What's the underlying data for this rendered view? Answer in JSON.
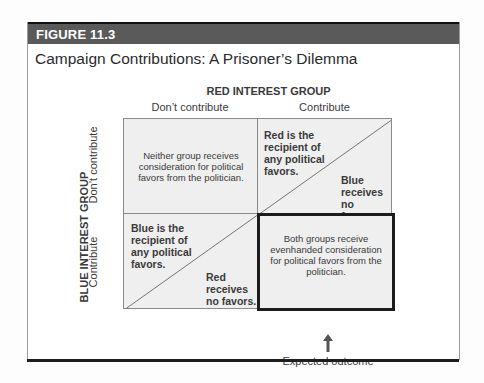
{
  "figure": {
    "label": "FIGURE 11.3",
    "title": "Campaign Contributions: A Prisoner’s Dilemma"
  },
  "matrix": {
    "column_player": "RED INTEREST GROUP",
    "row_player": "BLUE INTEREST GROUP",
    "columns": [
      "Don’t contribute",
      "Contribute"
    ],
    "rows": [
      "Don’t contribute",
      "Contribute"
    ],
    "cells": {
      "top_left": "Neither group receives consideration for political favors from the politician.",
      "top_right": {
        "upper": "Red is the recipient of any political favors.",
        "lower": "Blue receives no favors."
      },
      "bottom_left": {
        "upper": "Blue is the recipient of any political favors.",
        "lower": "Red receives no favors."
      },
      "bottom_right": "Both groups receive evenhanded consideration for political favors from the politician."
    },
    "highlighted_cell": "bottom_right",
    "annotation": "Expected outcome"
  },
  "colors": {
    "header_bg": "#5a5a5a",
    "cell_bg": "#efefef",
    "outcome_border": "#1c1c1c"
  }
}
